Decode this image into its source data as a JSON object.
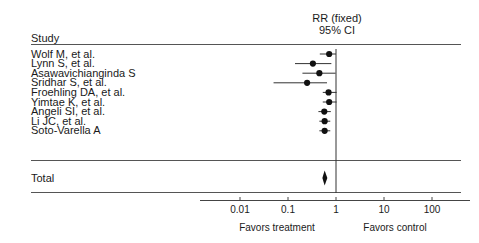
{
  "header": {
    "study_column": "Study",
    "effect_title_line1": "RR (fixed)",
    "effect_title_line2": "95% CI"
  },
  "footer": {
    "left_label": "Favors treatment",
    "right_label": "Favors control"
  },
  "chart_data": {
    "type": "forest",
    "xlabel": "",
    "ylabel": "",
    "x_scale": "log",
    "xlim": [
      0.003,
      300
    ],
    "ticks": [
      "0.01",
      "0.1",
      "1",
      "10",
      "100"
    ],
    "tick_values": [
      0.01,
      0.1,
      1,
      10,
      100
    ],
    "null_line": 1,
    "grid": false,
    "effect_measure": "RR (fixed)",
    "confidence_level": "95% CI",
    "favors_left": "Favors treatment",
    "favors_right": "Favors control",
    "studies": [
      {
        "label": "Wolf M, et al.",
        "rr": 0.72,
        "lower": 0.46,
        "upper": 1.0
      },
      {
        "label": "Lynn S, et al.",
        "rr": 0.33,
        "lower": 0.14,
        "upper": 0.8
      },
      {
        "label": "Asawavichianginda S",
        "rr": 0.45,
        "lower": 0.2,
        "upper": 0.98
      },
      {
        "label": "Sridhar S, et al.",
        "rr": 0.25,
        "lower": 0.05,
        "upper": 0.65
      },
      {
        "label": "Froehling DA, et al.",
        "rr": 0.7,
        "lower": 0.53,
        "upper": 1.03
      },
      {
        "label": "Yimtae K, et al.",
        "rr": 0.72,
        "lower": 0.53,
        "upper": 1.03
      },
      {
        "label": "Angeli SI, et al.",
        "rr": 0.57,
        "lower": 0.43,
        "upper": 0.78
      },
      {
        "label": "Li JC, et al.",
        "rr": 0.58,
        "lower": 0.45,
        "upper": 0.76
      },
      {
        "label": "Soto-Varella A",
        "rr": 0.58,
        "lower": 0.45,
        "upper": 0.76
      }
    ],
    "total": {
      "label": "Total",
      "rr": 0.58,
      "lower": 0.52,
      "upper": 0.66
    }
  },
  "style": {
    "marker_color": "#111111",
    "line_color": "#333333",
    "axis_color": "#444444",
    "rule_color": "#555555",
    "background": "#ffffff"
  }
}
